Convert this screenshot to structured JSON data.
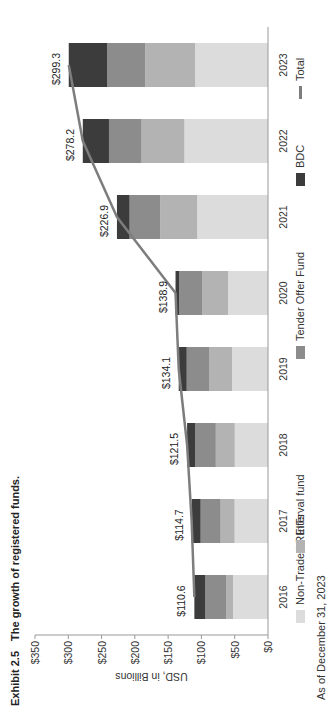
{
  "title": {
    "exhibit": "Exhibit 2.5",
    "text": "The growth of registered funds."
  },
  "footnote": "As of December 31, 2023",
  "legend": [
    {
      "label": "Non-Traded REITs",
      "color": "#dcdcdc",
      "type": "bar"
    },
    {
      "label": "Interval fund",
      "color": "#b3b3b3",
      "type": "bar"
    },
    {
      "label": "Tender Offer Fund",
      "color": "#8c8c8c",
      "type": "bar"
    },
    {
      "label": "BDC",
      "color": "#3c3c3c",
      "type": "bar"
    },
    {
      "label": "Total",
      "color": "#7d7d7d",
      "type": "line"
    }
  ],
  "chart_data": {
    "type": "bar",
    "stacked": true,
    "orientation": "vertical (figure rotated 90° counter-clockwise)",
    "xlabel": "",
    "ylabel": "USD, in Billions",
    "ylim": [
      0,
      350
    ],
    "yticks": [
      "$0",
      "$50",
      "$100",
      "$150",
      "$200",
      "$250",
      "$300",
      "$350"
    ],
    "grid": false,
    "legend_position": "bottom",
    "categories": [
      "2016",
      "2017",
      "2018",
      "2019",
      "2020",
      "2021",
      "2022",
      "2023"
    ],
    "series": [
      {
        "name": "Non-Traded REITs",
        "color": "#dcdcdc",
        "values": [
          52.6,
          50.2,
          49.9,
          54.1,
          60.1,
          106.4,
          125.6,
          109.6
        ]
      },
      {
        "name": "Interval fund",
        "color": "#b3b3b3",
        "values": [
          10.5,
          21.0,
          28.5,
          34.5,
          39.0,
          55.5,
          64.3,
          74.9
        ]
      },
      {
        "name": "Tender Offer Fund",
        "color": "#8c8c8c",
        "values": [
          31.5,
          30.0,
          31.1,
          33.5,
          34.6,
          46.0,
          49.0,
          57.0
        ]
      },
      {
        "name": "BDC",
        "color": "#3c3c3c",
        "values": [
          16.0,
          13.5,
          12.0,
          12.0,
          5.2,
          19.0,
          39.3,
          57.8
        ]
      }
    ],
    "line_series": {
      "name": "Total",
      "color": "#7d7d7d",
      "values": [
        110.6,
        114.7,
        121.5,
        134.1,
        138.9,
        226.9,
        278.2,
        299.3
      ]
    },
    "data_labels": [
      "$110.6",
      "$114.7",
      "$121.5",
      "$134.1",
      "$138.9",
      "$226.9",
      "$278.2",
      "$299.3"
    ]
  }
}
